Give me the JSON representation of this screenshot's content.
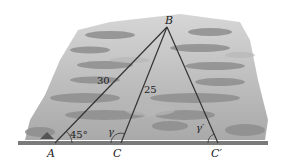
{
  "diagram": {
    "vertices": {
      "A": {
        "label": "A",
        "x": 55,
        "y": 143
      },
      "B": {
        "label": "B",
        "x": 167,
        "y": 27
      },
      "C": {
        "label": "C",
        "x": 121,
        "y": 143
      },
      "C_prime": {
        "label": "C′",
        "x": 218,
        "y": 143
      }
    },
    "side_labels": {
      "AB": "30",
      "BC": "25"
    },
    "angle_labels": {
      "A": "45°",
      "C": "γ",
      "C_prime": "γ′"
    },
    "colors": {
      "line": "#333333",
      "ground": "#777777",
      "background_dark": "#8a8a8a",
      "background_light": "#c8c8c8"
    }
  }
}
